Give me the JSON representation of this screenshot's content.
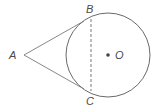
{
  "diagram": {
    "type": "geometry",
    "colors": {
      "stroke": "#6a6a6a",
      "label": "#4a4a4a",
      "background": "#ffffff"
    },
    "circle": {
      "center_label": "O",
      "cx": 108,
      "cy": 55,
      "r": 42
    },
    "points": {
      "A": {
        "label": "A",
        "x": 24,
        "y": 55
      },
      "B": {
        "label": "B",
        "x": 91,
        "y": 19
      },
      "C": {
        "label": "C",
        "x": 91,
        "y": 91
      },
      "O": {
        "label": "O",
        "x": 108,
        "y": 55
      }
    },
    "segments": [
      {
        "from": "A",
        "to": "B",
        "style": "solid"
      },
      {
        "from": "A",
        "to": "C",
        "style": "solid"
      },
      {
        "from": "B",
        "to": "C",
        "style": "dashed"
      }
    ]
  }
}
